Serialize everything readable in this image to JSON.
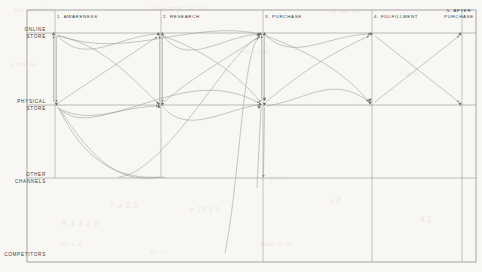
{
  "colors": {
    "background": "#f8f7f4",
    "frame": "#6f6f6f",
    "gridline": "#8a8a8a",
    "flowline": "#9a9a9a",
    "text": "#3a3a3a",
    "ghost_text": "#ded9d2"
  },
  "axes": {
    "rows_label": "Channels",
    "columns_label": "Journey stages"
  },
  "rows": [
    {
      "id": "online-store",
      "label": "ONLINE\nSTORE",
      "y": 33
    },
    {
      "id": "physical-store",
      "label": "PHYSICAL\nSTORE",
      "y": 105
    },
    {
      "id": "other-channels",
      "label": "OTHER\nCHANNELS",
      "y": 178
    },
    {
      "id": "competitors",
      "label": "COMPETITORS",
      "y": 255
    }
  ],
  "columns": [
    {
      "id": "awareness",
      "label": "1. AWARENESS",
      "x": 55,
      "align": "left"
    },
    {
      "id": "research",
      "label": "2. RESEARCH",
      "x": 161,
      "align": "left"
    },
    {
      "id": "purchase",
      "label": "3. PURCHASE",
      "x": 263,
      "align": "left"
    },
    {
      "id": "fulfillment",
      "label": "4. FULFILLMENT",
      "x": 372,
      "align": "left"
    },
    {
      "id": "after-purchase",
      "label": "5. AFTER\nPURCHASE",
      "x": 462,
      "align": "center"
    }
  ],
  "frame": {
    "x": 27,
    "y": 10,
    "width": 449,
    "height": 252
  },
  "chart_data": {
    "type": "diagram",
    "xlabel": "Journey stage",
    "ylabel": "Channel",
    "grid": true,
    "legend": "none",
    "categories": [
      "1. AWARENESS",
      "2. RESEARCH",
      "3. PURCHASE",
      "4. FULFILLMENT",
      "5. AFTER PURCHASE"
    ],
    "lanes": [
      "ONLINE STORE",
      "PHYSICAL STORE",
      "OTHER CHANNELS",
      "COMPETITORS"
    ],
    "node_count": 20,
    "flow_count": 24,
    "flows": [
      {
        "from": "awareness/online",
        "to": "awareness/physical",
        "shape": "straight"
      },
      {
        "from": "awareness/physical",
        "to": "awareness/online",
        "shape": "straight"
      },
      {
        "from": "awareness/online",
        "to": "research/online",
        "shape": "curve"
      },
      {
        "from": "awareness/online",
        "to": "research/physical",
        "shape": "curve"
      },
      {
        "from": "awareness/physical",
        "to": "research/online",
        "shape": "straight"
      },
      {
        "from": "awareness/physical",
        "to": "research/physical",
        "shape": "curve"
      },
      {
        "from": "awareness/online",
        "to": "purchase/online",
        "shape": "curve"
      },
      {
        "from": "awareness/physical",
        "to": "purchase/physical",
        "shape": "curve"
      },
      {
        "from": "research/online",
        "to": "research/physical",
        "shape": "straight"
      },
      {
        "from": "research/physical",
        "to": "research/online",
        "shape": "straight"
      },
      {
        "from": "research/online",
        "to": "purchase/online",
        "shape": "curve"
      },
      {
        "from": "research/online",
        "to": "purchase/physical",
        "shape": "curve"
      },
      {
        "from": "research/physical",
        "to": "purchase/online",
        "shape": "curve"
      },
      {
        "from": "research/physical",
        "to": "purchase/physical",
        "shape": "curve"
      },
      {
        "from": "other/research",
        "to": "purchase/online",
        "shape": "curve"
      },
      {
        "from": "competitors",
        "to": "purchase/online",
        "shape": "curve"
      },
      {
        "from": "purchase/online",
        "to": "purchase/physical",
        "shape": "straight"
      },
      {
        "from": "purchase/physical",
        "to": "purchase/online",
        "shape": "straight"
      },
      {
        "from": "purchase/online",
        "to": "fulfillment/online",
        "shape": "curve"
      },
      {
        "from": "purchase/online",
        "to": "fulfillment/physical",
        "shape": "curve"
      },
      {
        "from": "purchase/physical",
        "to": "fulfillment/online",
        "shape": "curve"
      },
      {
        "from": "fulfillment/online",
        "to": "after/physical",
        "shape": "straight"
      },
      {
        "from": "fulfillment/physical",
        "to": "after/online",
        "shape": "straight"
      },
      {
        "from": "purchase/physical",
        "to": "other/purchase",
        "shape": "straight"
      }
    ]
  },
  "ghost_lines": [
    {
      "text": "the  and  of  a",
      "x": 14,
      "y": 6,
      "size": 7
    },
    {
      "text": "in  to  with  for  an",
      "x": 150,
      "y": 4,
      "size": 7
    },
    {
      "text": "of  the  to",
      "x": 330,
      "y": 7,
      "size": 7
    },
    {
      "text": "a  per  de",
      "x": 10,
      "y": 60,
      "size": 7
    },
    {
      "text": "con  tra  mi",
      "x": 240,
      "y": 48,
      "size": 6
    },
    {
      "text": "e  la  di",
      "x": 400,
      "y": 70,
      "size": 6
    },
    {
      "text": "sal-ti",
      "x": 270,
      "y": 175,
      "size": 6
    },
    {
      "text": "7   a  2 3",
      "x": 110,
      "y": 200,
      "size": 9
    },
    {
      "text": "9 4  1  2 0",
      "x": 62,
      "y": 218,
      "size": 9
    },
    {
      "text": "e  29  2  1",
      "x": 190,
      "y": 205,
      "size": 8
    },
    {
      "text": "a  8",
      "x": 330,
      "y": 196,
      "size": 8
    },
    {
      "text": "4 2",
      "x": 420,
      "y": 215,
      "size": 8
    },
    {
      "text": "rte  u  n",
      "x": 60,
      "y": 240,
      "size": 7
    },
    {
      "text": "men  of  os",
      "x": 260,
      "y": 240,
      "size": 7
    },
    {
      "text": "no  a  r",
      "x": 150,
      "y": 248,
      "size": 6
    }
  ]
}
